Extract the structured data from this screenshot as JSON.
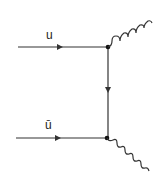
{
  "diagram": {
    "type": "feynman",
    "labels": {
      "top_incoming": "u",
      "bottom_incoming": "ū"
    },
    "colors": {
      "line": "#333333",
      "background": "#ffffff"
    }
  }
}
